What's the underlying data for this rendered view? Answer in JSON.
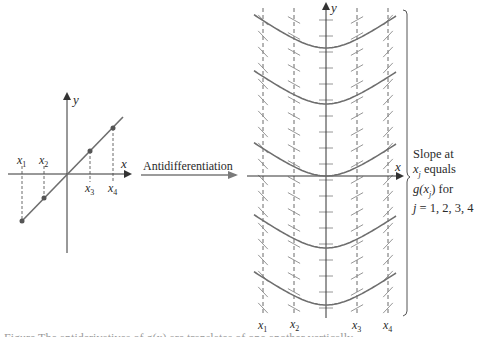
{
  "colors": {
    "axis": "#333333",
    "curve": "#6e6e6e",
    "point": "#555555",
    "dashed": "#444444",
    "arrow": "#7a7a7a",
    "text": "#2a2a2a"
  },
  "left_graph": {
    "x_axis_label": "x",
    "y_axis_label": "y",
    "point_labels": [
      "x1",
      "x2",
      "x3",
      "x4"
    ],
    "points": [
      {
        "label": "x1",
        "sub": "1",
        "px": 22,
        "py": 221
      },
      {
        "label": "x2",
        "sub": "2",
        "px": 44,
        "py": 198
      },
      {
        "label": "x3",
        "sub": "3",
        "px": 90,
        "py": 151
      },
      {
        "label": "x4",
        "sub": "4",
        "px": 113,
        "py": 128
      }
    ]
  },
  "transition": {
    "label": "Antidifferentiation"
  },
  "right_graph": {
    "x_axis_label": "x",
    "y_axis_label": "y",
    "dashed_labels": [
      "x1",
      "x2",
      "x3",
      "x4"
    ],
    "dashed_subs": [
      "1",
      "2",
      "3",
      "4"
    ],
    "curve_vertices_y": [
      48,
      104,
      176,
      248,
      305
    ],
    "curve_count": 5
  },
  "side_note": {
    "line1": "Slope at",
    "line2_var": "x",
    "line2_sub": "j",
    "line2_rest": " equals",
    "line3_fn": "g(x",
    "line3_sub": "j",
    "line3_rest": ") for",
    "line4": "j = 1, 2, 3, 4"
  },
  "caption": {
    "text": "Figure     The antiderivatives of g(x) are translates of one another vertically"
  }
}
